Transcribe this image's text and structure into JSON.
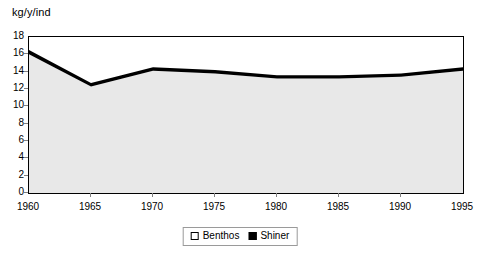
{
  "chart_data": {
    "type": "area",
    "title": "kg/y/ind",
    "xlabel": "",
    "ylabel": "kg/y/ind",
    "x": [
      1960,
      1965,
      1970,
      1975,
      1980,
      1985,
      1990,
      1995
    ],
    "categories": [
      "1960",
      "1965",
      "1970",
      "1975",
      "1980",
      "1985",
      "1990",
      "1995"
    ],
    "series": [
      {
        "name": "Benthos",
        "color": "#e8e8e8",
        "values": [
          16.0,
          12.3,
          14.1,
          13.8,
          13.2,
          13.2,
          13.4,
          14.1
        ]
      },
      {
        "name": "Shiner",
        "color": "#000000",
        "values": [
          0.5,
          0.4,
          0.4,
          0.4,
          0.4,
          0.4,
          0.4,
          0.4
        ]
      }
    ],
    "totals": [
      16.5,
      12.7,
      14.5,
      14.2,
      13.6,
      13.6,
      13.8,
      14.5
    ],
    "xlim": [
      1960,
      1995
    ],
    "ylim": [
      0,
      18
    ],
    "ytick_step": 2,
    "xtick_step": 5,
    "yticks": [
      "18",
      "16",
      "14",
      "12",
      "10",
      "8",
      "6",
      "4",
      "2",
      "0"
    ],
    "ytick_values": [
      18,
      16,
      14,
      12,
      10,
      8,
      6,
      4,
      2,
      0
    ],
    "grid": false,
    "legend_position": "bottom-center",
    "legend": [
      {
        "label": "Benthos",
        "swatch": "hollow"
      },
      {
        "label": "Shiner",
        "swatch": "filled"
      }
    ]
  }
}
